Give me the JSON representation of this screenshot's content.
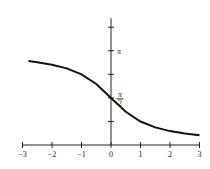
{
  "chart_data": {
    "type": "line",
    "title": "",
    "xlabel": "",
    "ylabel": "",
    "function": "arccot(x)",
    "xlim": [
      -3,
      3
    ],
    "ylim": [
      0,
      3.927
    ],
    "grid": false,
    "x_ticks": [
      -3,
      -2,
      -1,
      0,
      1,
      2,
      3
    ],
    "x_tick_labels": [
      "−3",
      "−2",
      "−1",
      "0",
      "1",
      "2",
      "3"
    ],
    "y_ticks": [
      0.7854,
      1.5708,
      2.3562,
      3.1416,
      3.927
    ],
    "y_tick_labels": [
      {
        "value": 1.5708,
        "numerator": "π",
        "denominator": "2"
      },
      {
        "value": 3.1416,
        "text": "π"
      }
    ],
    "series": [
      {
        "name": "arccot(x)",
        "x": [
          -2.8,
          -2.5,
          -2,
          -1.5,
          -1,
          -0.5,
          0,
          0.5,
          1,
          1.5,
          2,
          2.5,
          3
        ],
        "y": [
          2.799,
          2.761,
          2.678,
          2.554,
          2.356,
          2.034,
          1.571,
          1.107,
          0.785,
          0.588,
          0.464,
          0.381,
          0.322
        ]
      }
    ]
  }
}
